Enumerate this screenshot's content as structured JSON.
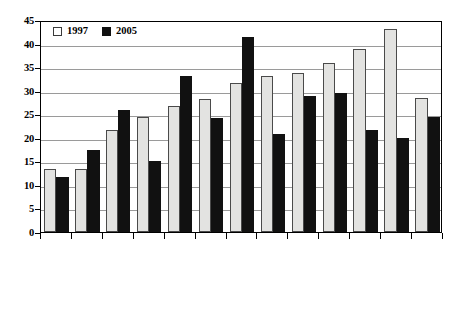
{
  "chart_data": {
    "type": "bar",
    "title": "",
    "subtitle": "",
    "xlabel": "",
    "ylabel": "",
    "ylim": [
      0,
      45
    ],
    "ytick_values": [
      0,
      5,
      10,
      15,
      20,
      25,
      30,
      35,
      40,
      45
    ],
    "ytick_labels": [
      "0",
      "5",
      "10",
      "15",
      "20",
      "25",
      "30",
      "35",
      "40",
      "45"
    ],
    "grid": true,
    "grid_axis": "y",
    "legend_position": "top-left-inside",
    "categories": [
      "MYANMAR",
      "CAMPODIA",
      "INDIA",
      "PHILIPPINES",
      "VIETNAM",
      "INDONESIA",
      "CHINA",
      "HONGKONG",
      "THAILAND",
      "KOREA",
      "SINGAPORE",
      "MALAYSIA",
      "AVERAGE"
    ],
    "series": [
      {
        "name": "1997",
        "color": "#e3e3e1",
        "values": [
          13.4,
          13.3,
          21.7,
          24.5,
          26.7,
          28.3,
          31.7,
          33.1,
          33.8,
          35.9,
          38.8,
          43.0,
          28.5
        ]
      },
      {
        "name": "2005",
        "color": "#111111",
        "values": [
          11.7,
          17.5,
          25.9,
          15.1,
          33.1,
          24.3,
          41.5,
          20.8,
          28.8,
          29.5,
          21.6,
          19.9,
          24.5
        ]
      }
    ]
  },
  "legend": {
    "items": [
      {
        "label": "1997",
        "swatch": "light-square-swatch"
      },
      {
        "label": "2005",
        "swatch": "dark-square-swatch"
      }
    ]
  }
}
